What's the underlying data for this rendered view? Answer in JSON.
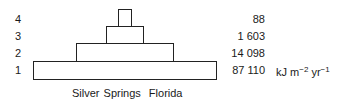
{
  "diagram": {
    "type": "energy-pyramid",
    "location": [
      "Silver Springs",
      "Florida"
    ],
    "unit": {
      "base": "kJ m",
      "exp1": "−2",
      "mid": " yr",
      "exp2": "−1"
    },
    "levels": [
      {
        "label": "4",
        "value": "88"
      },
      {
        "label": "3",
        "value": "1 603"
      },
      {
        "label": "2",
        "value": "14 098"
      },
      {
        "label": "1",
        "value": "87 110"
      }
    ]
  }
}
